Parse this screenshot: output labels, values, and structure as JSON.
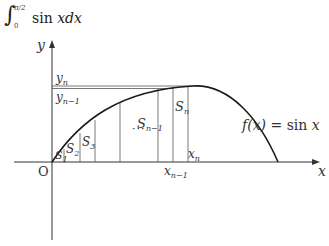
{
  "formula": {
    "integral_sign": "∫",
    "upper_limit": "π/2",
    "lower_limit": "0",
    "integrand": "sin",
    "variable_part": "xdx"
  },
  "axes": {
    "x_label": "x",
    "y_label": "y",
    "origin_label": "O"
  },
  "function_label": {
    "lhs": "f(x) = ",
    "rhs_fn": "sin",
    "rhs_var": "x"
  },
  "y_labels": [
    {
      "base": "y",
      "sub": "n"
    },
    {
      "base": "y",
      "sub": "n−1"
    }
  ],
  "x_labels": [
    {
      "base": "x",
      "sub": "n"
    },
    {
      "base": "x",
      "sub": "n−1"
    }
  ],
  "strip_labels": [
    {
      "base": "S",
      "sub": "1"
    },
    {
      "base": "S",
      "sub": "2"
    },
    {
      "base": "S",
      "sub": "3"
    },
    {
      "base": "S",
      "sub": "n−1"
    },
    {
      "base": "S",
      "sub": "n"
    }
  ],
  "ellipsis": "···",
  "colors": {
    "curve": "#1a1a1a",
    "axis": "#333333",
    "grid_line": "#555555",
    "background": "#ffffff"
  }
}
